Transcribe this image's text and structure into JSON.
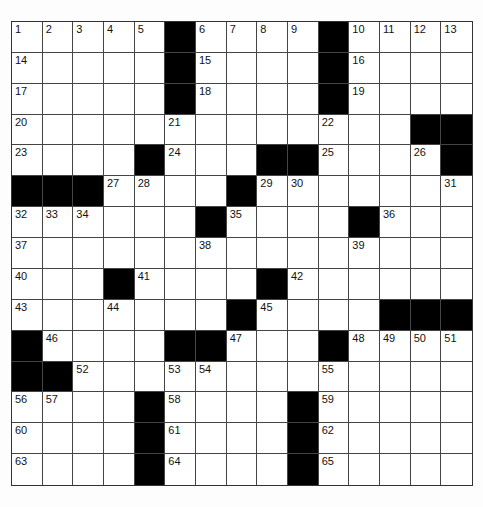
{
  "puzzle": {
    "rows": 15,
    "cols": 15,
    "colors": {
      "block": "#000000",
      "cell": "#ffffff",
      "line": "#444444",
      "background": "#fdfdfd"
    },
    "grid": [
      [
        "1",
        "2",
        "3",
        "4",
        "5",
        "#",
        "6",
        "7",
        "8",
        "9",
        "#",
        "10",
        "11",
        "12",
        "13"
      ],
      [
        "14",
        ".",
        ".",
        ".",
        ".",
        "#",
        "15",
        ".",
        ".",
        ".",
        "#",
        "16",
        ".",
        ".",
        "."
      ],
      [
        "17",
        ".",
        ".",
        ".",
        ".",
        "#",
        "18",
        ".",
        ".",
        ".",
        "#",
        "19",
        ".",
        ".",
        "."
      ],
      [
        "20",
        ".",
        ".",
        ".",
        ".",
        "21",
        ".",
        ".",
        ".",
        ".",
        "22",
        ".",
        ".",
        "#",
        "#"
      ],
      [
        "23",
        ".",
        ".",
        ".",
        "#",
        "24",
        ".",
        ".",
        "#",
        "#",
        "25",
        ".",
        ".",
        "26",
        "#"
      ],
      [
        "#",
        "#",
        "#",
        "27",
        "28",
        ".",
        ".",
        "#",
        "29",
        "30",
        ".",
        ".",
        ".",
        ".",
        "31"
      ],
      [
        "32",
        "33",
        "34",
        ".",
        ".",
        ".",
        "#",
        "35",
        ".",
        ".",
        ".",
        "#",
        "36",
        ".",
        "."
      ],
      [
        "37",
        ".",
        ".",
        ".",
        ".",
        ".",
        "38",
        ".",
        ".",
        ".",
        ".",
        "39",
        ".",
        ".",
        "."
      ],
      [
        "40",
        ".",
        ".",
        "#",
        "41",
        ".",
        ".",
        ".",
        "#",
        "42",
        ".",
        ".",
        ".",
        ".",
        "."
      ],
      [
        "43",
        ".",
        ".",
        "44",
        ".",
        ".",
        ".",
        "#",
        "45",
        ".",
        ".",
        ".",
        "#",
        "#",
        "#"
      ],
      [
        "#",
        "46",
        ".",
        ".",
        ".",
        "#",
        "#",
        "47",
        ".",
        ".",
        "#",
        "48",
        "49",
        "50",
        "51"
      ],
      [
        "#",
        "#",
        "52",
        ".",
        ".",
        "53",
        "54",
        ".",
        ".",
        ".",
        "55",
        ".",
        ".",
        ".",
        "."
      ],
      [
        "56",
        "57",
        ".",
        ".",
        "#",
        "58",
        ".",
        ".",
        ".",
        "#",
        "59",
        ".",
        ".",
        ".",
        "."
      ],
      [
        "60",
        ".",
        ".",
        ".",
        "#",
        "61",
        ".",
        ".",
        ".",
        "#",
        "62",
        ".",
        ".",
        ".",
        "."
      ],
      [
        "63",
        ".",
        ".",
        ".",
        "#",
        "64",
        ".",
        ".",
        ".",
        "#",
        "65",
        ".",
        ".",
        ".",
        "."
      ]
    ]
  }
}
